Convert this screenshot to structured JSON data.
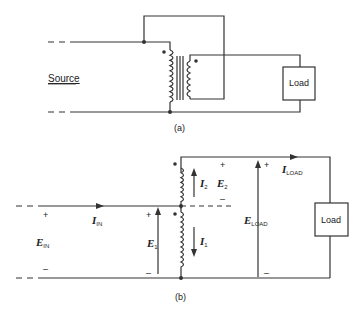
{
  "diagram_a": {
    "source_label": "Source",
    "load_label": "Load",
    "caption": "(a)"
  },
  "diagram_b": {
    "load_label": "Load",
    "caption": "(b)",
    "labels": {
      "E_in": "E",
      "E_in_sub": "IN",
      "I_in": "I",
      "I_in_sub": "IN",
      "E_1": "E",
      "E_1_sub": "1",
      "I_1": "I",
      "I_1_sub": "1",
      "I_2": "I",
      "I_2_sub": "2",
      "E_2": "E",
      "E_2_sub": "2",
      "E_load": "E",
      "E_load_sub": "LOAD",
      "I_load": "I",
      "I_load_sub": "LOAD"
    },
    "plus": "+",
    "minus": "–"
  },
  "colors": {
    "line": "#333333",
    "text": "#222222"
  }
}
